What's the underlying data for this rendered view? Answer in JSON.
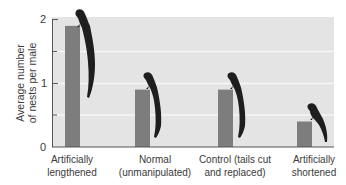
{
  "chart_data": {
    "type": "bar",
    "title": "",
    "xlabel": "",
    "ylabel": "Average number of nests per male",
    "ylabel_lines": [
      "Average number",
      "of nests per male"
    ],
    "ylim": [
      0,
      2
    ],
    "yticks": [
      0,
      1,
      2
    ],
    "minor_yticks": [
      0.5,
      1.5
    ],
    "grid": true,
    "legend": null,
    "categories": [
      "Artificially lengthened",
      "Normal (unmanipulated)",
      "Control (tails cut and replaced)",
      "Artificially shortened"
    ],
    "category_label_lines": [
      [
        "Artificially",
        "lengthened"
      ],
      [
        "Normal",
        "(unmanipulated)"
      ],
      [
        "Control (tails cut",
        "and replaced)"
      ],
      [
        "Artificially",
        "shortened"
      ]
    ],
    "values": [
      1.9,
      0.9,
      0.9,
      0.4
    ],
    "annotations": [
      {
        "category": "Artificially lengthened",
        "icon": "long-tailed-bird-icon",
        "tail": "very long"
      },
      {
        "category": "Normal (unmanipulated)",
        "icon": "long-tailed-bird-icon",
        "tail": "normal"
      },
      {
        "category": "Control (tails cut and replaced)",
        "icon": "long-tailed-bird-icon",
        "tail": "normal"
      },
      {
        "category": "Artificially shortened",
        "icon": "long-tailed-bird-icon",
        "tail": "short"
      }
    ]
  },
  "colors": {
    "bar": "#7d7d7d",
    "plot_bg": "#e4e4e4",
    "grid": "#f7f7f7",
    "axis": "#555555",
    "bird": "#1e1e1e",
    "text": "#3a3a3a"
  }
}
